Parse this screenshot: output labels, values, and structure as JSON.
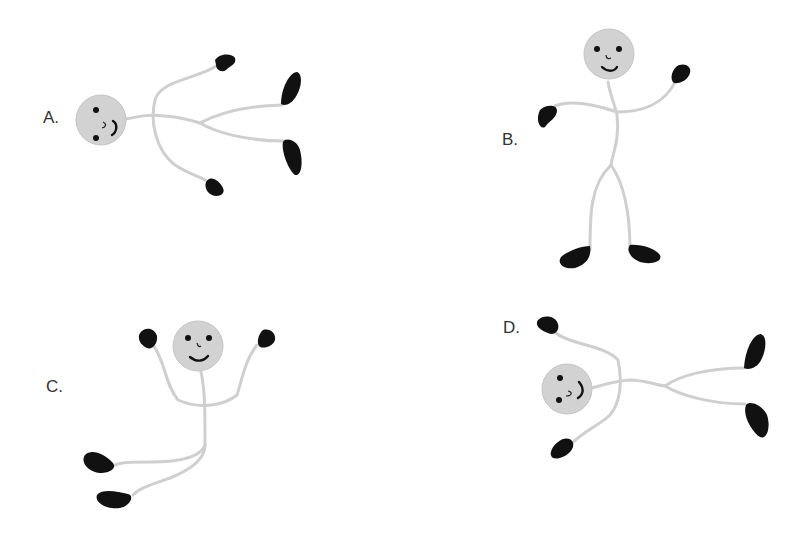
{
  "figure": {
    "panels": [
      {
        "label": "A.",
        "pose": "lying horizontal, head left, feet right"
      },
      {
        "label": "B.",
        "pose": "standing upright, arms out"
      },
      {
        "label": "C.",
        "pose": "arms raised, legs swept to lower-left"
      },
      {
        "label": "D.",
        "pose": "lying horizontal, head left, feet right"
      }
    ]
  },
  "colors": {
    "background": "#ffffff",
    "head": "#d2d2d2",
    "limbs": "#cfcfcf",
    "hands_feet": "#111111",
    "label_text": "#333333"
  }
}
